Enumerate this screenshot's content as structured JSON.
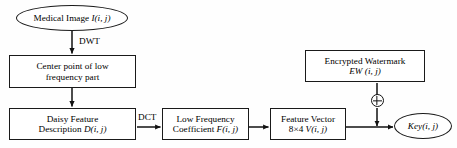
{
  "diagram": {
    "stroke_color": "#1a1a1a",
    "background_color": "#fefefe",
    "nodes": {
      "medical_image": {
        "label": "Medical Image ",
        "label_math": "I(i, j)",
        "shape": "ellipse"
      },
      "center_point": {
        "line1": "Center point of low",
        "line2": "frequency part",
        "shape": "rect"
      },
      "daisy_feature": {
        "line1": "Daisy Feature",
        "line2_pre": "Description ",
        "line2_math": "D(i, j)",
        "shape": "rect"
      },
      "low_freq_coeff": {
        "line1": "Low Frequency",
        "line2_pre": "Coefficient ",
        "line2_math": "F(i, j)",
        "shape": "rect"
      },
      "feature_vector": {
        "line1": "Feature Vector",
        "line2_pre": "8×4  ",
        "line2_math": "V(i, j)",
        "shape": "rect"
      },
      "encrypted_watermark": {
        "line1": "Encrypted Watermark",
        "line2_math": "EW (i, j)",
        "shape": "rect"
      },
      "key_output": {
        "label_math": "Key(i, j)",
        "shape": "ellipse"
      }
    },
    "edge_labels": {
      "dwt": "DWT",
      "dct": "DCT"
    },
    "operators": {
      "xor": "⊕"
    }
  }
}
